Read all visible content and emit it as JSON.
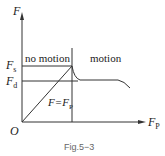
{
  "figure": {
    "y_axis_label": "F",
    "x_axis_label": "F",
    "x_axis_label_sub": "P",
    "origin_label": "O",
    "fs_label": "F",
    "fs_sub": "s",
    "fd_label": "F",
    "fd_sub": "d",
    "region_left": "no motion",
    "region_right": "motion",
    "line_label": "F=F",
    "line_label_sub": "P",
    "caption": "Fig.5−3"
  },
  "colors": {
    "line": "#333333",
    "text": "#222222",
    "caption": "#666666"
  }
}
